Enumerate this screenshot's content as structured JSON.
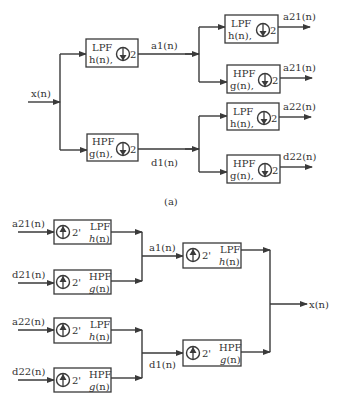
{
  "decomposition": {
    "input_label": "x(n)",
    "level1": {
      "lpf": {
        "name": "LPF",
        "filter": "h(n),",
        "factor": "2",
        "output": "a1(n)"
      },
      "hpf": {
        "name": "HPF",
        "filter": "g(n),",
        "factor": "2",
        "output": "d1(n)"
      }
    },
    "level2": [
      {
        "name": "LPF",
        "filter": "h(n),",
        "factor": "2",
        "output": "a21(n)"
      },
      {
        "name": "HPF",
        "filter": "g(n),",
        "factor": "2",
        "output": "a21(n)"
      },
      {
        "name": "LPF",
        "filter": "h(n),",
        "factor": "2",
        "output": "a22(n)"
      },
      {
        "name": "HPF",
        "filter": "g(n),",
        "factor": "2",
        "output": "d22(n)"
      }
    ],
    "caption": "(a)"
  },
  "reconstruction": {
    "level2": [
      {
        "input": "a21(n)",
        "factor": "2'",
        "name": "LPF",
        "filter_fn": "h",
        "filter_arg": "(n)"
      },
      {
        "input": "d21(n)",
        "factor": "2'",
        "name": "HPF",
        "filter_fn": "g",
        "filter_arg": "(n)"
      },
      {
        "input": "a22(n)",
        "factor": "2'",
        "name": "LPF",
        "filter_fn": "h",
        "filter_arg": "(n)"
      },
      {
        "input": "d22(n)",
        "factor": "2'",
        "name": "HPF",
        "filter_fn": "g",
        "filter_arg": "(n)"
      }
    ],
    "level1": {
      "lpf": {
        "input": "a1(n)",
        "factor": "2'",
        "name": "LPF",
        "filter_fn": "h",
        "filter_arg": "(n)"
      },
      "hpf": {
        "input": "d1(n)",
        "factor": "2'",
        "name": "HPF",
        "filter_fn": "g",
        "filter_arg": "(n)"
      }
    },
    "output_label": "x(n)"
  }
}
